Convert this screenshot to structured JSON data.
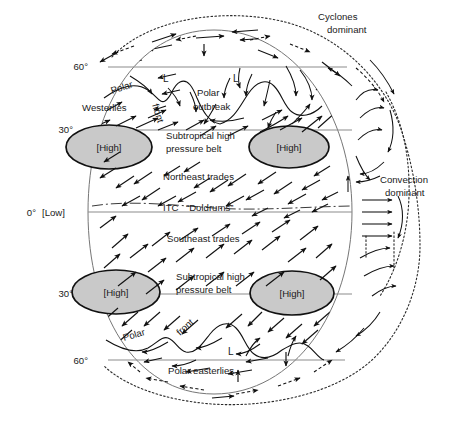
{
  "figure": {
    "background_color": "#ffffff",
    "ink_color": "#111111",
    "high_fill_color": "#c9c9c9",
    "globe_stroke_color": "#767676"
  },
  "latitude_labels": {
    "north_60": "60°",
    "north_30": "30°",
    "equator": "0°",
    "south_30": "30°",
    "south_60": "60°"
  },
  "pressure_cells": {
    "equatorial_low": "[Low]",
    "high_nw": "[High]",
    "high_ne": "[High]",
    "high_sw": "[High]",
    "high_se": "[High]"
  },
  "wind_belts": {
    "westerlies": "Westerlies",
    "northeast_trades": "Northeast trades",
    "southeast_trades": "Southeast trades",
    "polar_easterlies": "Polar easterlies"
  },
  "features": {
    "polar_front_north_word1": "Polar",
    "polar_front_north_word2": "front",
    "polar_front_south_word1": "Polar",
    "polar_front_south_word2": "front",
    "polar_outbreak_line1": "Polar",
    "polar_outbreak_line2": "outbreak",
    "subtropical_belt_north_line1": "Subtropical high",
    "subtropical_belt_north_line2": "pressure belt",
    "subtropical_belt_south_line1": "Subtropical high",
    "subtropical_belt_south_line2": "pressure belt",
    "itc": "ITC",
    "doldrums": "“Doldrums”",
    "low_marker_n1": "L",
    "low_marker_n2": "L",
    "low_marker_s1": "L"
  },
  "side_annotations": {
    "cyclones_line1": "Cyclones",
    "cyclones_line2": "dominant",
    "convection_line1": "Convection",
    "convection_line2": "dominant"
  }
}
